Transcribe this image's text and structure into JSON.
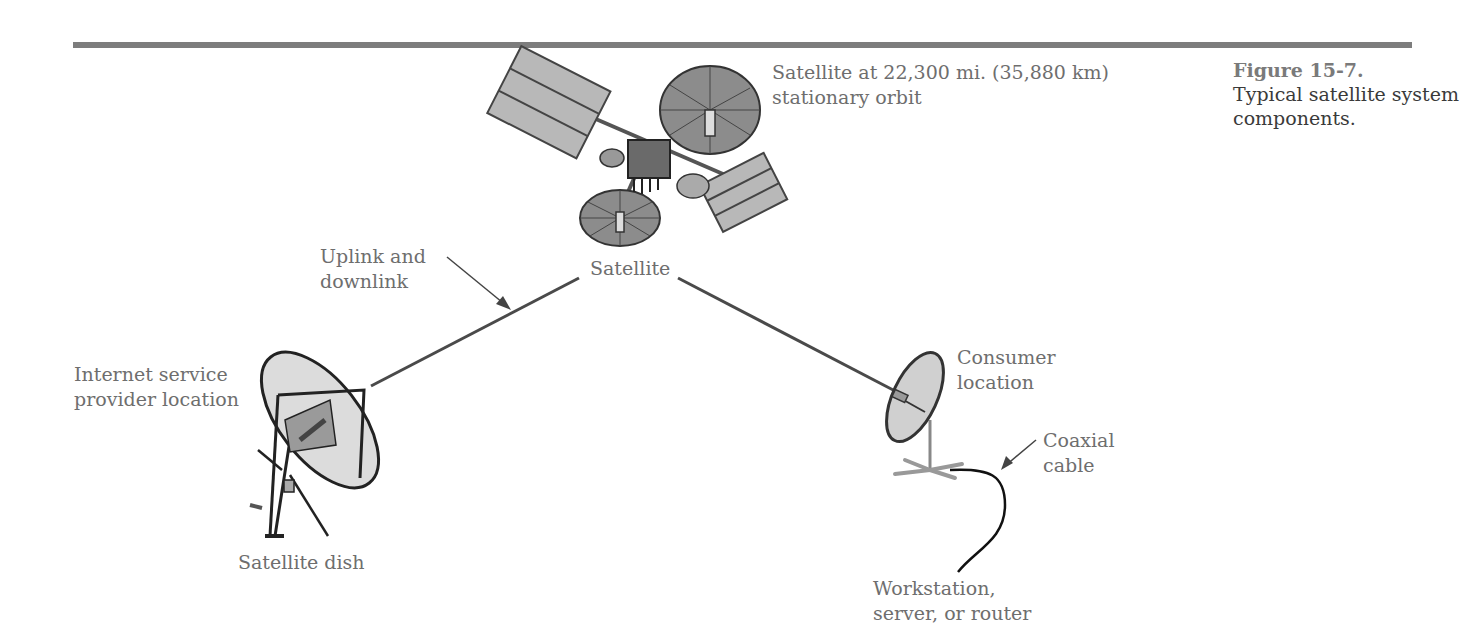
{
  "figure": {
    "number": "Figure 15-7.",
    "caption": "Typical satellite system\ncomponents."
  },
  "labels": {
    "satellite_orbit_line1": "Satellite at 22,300 mi. (35,880 km)",
    "satellite_orbit_line2": "stationary orbit",
    "satellite": "Satellite",
    "uplink_line1": "Uplink and",
    "uplink_line2": "downlink",
    "isp_line1": "Internet service",
    "isp_line2": "provider location",
    "satellite_dish": "Satellite dish",
    "consumer_line1": "Consumer",
    "consumer_line2": "location",
    "coax_line1": "Coaxial",
    "coax_line2": "cable",
    "workstation_line1": "Workstation,",
    "workstation_line2": "server, or router"
  },
  "colors": {
    "rule": "#7d7d7d",
    "link_line": "#4a4a4a",
    "dish_fill": "#d9d9d9",
    "panel_fill": "#b5b5b5",
    "antenna_fill": "#8a8a8a"
  }
}
